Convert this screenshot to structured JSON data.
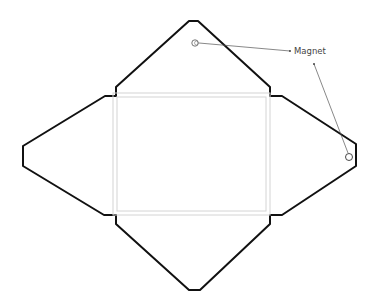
{
  "diagram": {
    "colors": {
      "outline": "#111111",
      "fold_lines": "#d4d4d4",
      "annotation": "#555555",
      "background": "#ffffff"
    },
    "annotation": {
      "label": "Magnet",
      "targets": [
        "top-flap-magnet",
        "right-flap-magnet"
      ]
    }
  }
}
